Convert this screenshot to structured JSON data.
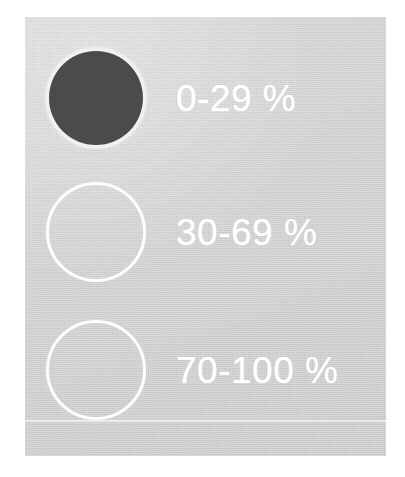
{
  "panel": {
    "background_color": "#d2d2d2",
    "outer_background_color": "#ffffff",
    "rule_color": "#ffffff"
  },
  "legend": {
    "title": "",
    "items": [
      {
        "label": "0-29 %",
        "range_min": 0,
        "range_max": 29,
        "unit": "%",
        "symbol": "filled-circle",
        "fill_color": "#4b4b4b",
        "stroke_color": "#ffffff"
      },
      {
        "label": "30-69 %",
        "range_min": 30,
        "range_max": 69,
        "unit": "%",
        "symbol": "hollow-circle",
        "fill_color": "transparent",
        "stroke_color": "#ffffff"
      },
      {
        "label": "70-100 %",
        "range_min": 70,
        "range_max": 100,
        "unit": "%",
        "symbol": "hollow-circle",
        "fill_color": "transparent",
        "stroke_color": "#ffffff"
      }
    ]
  },
  "chart_data": {
    "type": "table",
    "title": "",
    "xlabel": "",
    "ylabel": "",
    "categories": [
      "0-29 %",
      "30-69 %",
      "70-100 %"
    ],
    "values": [
      1,
      1,
      1
    ],
    "legend_position": "standalone",
    "grid": false,
    "annotations": [
      "Map legend key: circle symbol shading encodes a percentage class",
      "0-29 % = solid dark fill",
      "30-69 % = unfilled outline",
      "70-100 % = unfilled outline"
    ]
  }
}
